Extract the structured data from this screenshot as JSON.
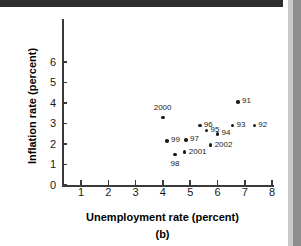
{
  "figure": {
    "panel_label": "(b)"
  },
  "chart_data": {
    "type": "scatter",
    "title": "",
    "xlabel": "Unemployment rate (percent)",
    "ylabel": "Inflation rate (percent)",
    "xlim": [
      0.4,
      8.3
    ],
    "ylim": [
      0,
      6
    ],
    "xticks": [
      1,
      2,
      3,
      4,
      5,
      6,
      7,
      8
    ],
    "yticks": [
      0,
      1,
      2,
      3,
      4,
      5,
      6
    ],
    "xtick_labels": [
      "1",
      "2",
      "3",
      "4",
      "5",
      "6",
      "7",
      "8"
    ],
    "ytick_labels": [
      "0",
      "1",
      "2",
      "3",
      "4",
      "5",
      "6"
    ],
    "grid": false,
    "legend": false,
    "points": [
      {
        "label": "91",
        "x": 6.75,
        "y": 4.05,
        "label_pos": "right"
      },
      {
        "label": "92",
        "x": 7.35,
        "y": 2.9,
        "label_pos": "right"
      },
      {
        "label": "93",
        "x": 6.55,
        "y": 2.9,
        "label_pos": "right"
      },
      {
        "label": "94",
        "x": 6.0,
        "y": 2.5,
        "label_pos": "right"
      },
      {
        "label": "95",
        "x": 5.6,
        "y": 2.65,
        "label_pos": "right"
      },
      {
        "label": "96",
        "x": 5.35,
        "y": 2.9,
        "label_pos": "right"
      },
      {
        "label": "97",
        "x": 4.85,
        "y": 2.2,
        "label_pos": "right"
      },
      {
        "label": "98",
        "x": 4.45,
        "y": 1.5,
        "label_pos": "below"
      },
      {
        "label": "99",
        "x": 4.15,
        "y": 2.15,
        "label_pos": "right"
      },
      {
        "label": "2000",
        "x": 4.0,
        "y": 3.3,
        "label_pos": "above"
      },
      {
        "label": "2001",
        "x": 4.8,
        "y": 1.6,
        "label_pos": "right"
      },
      {
        "label": "2002",
        "x": 5.75,
        "y": 1.95,
        "label_pos": "right"
      }
    ]
  }
}
